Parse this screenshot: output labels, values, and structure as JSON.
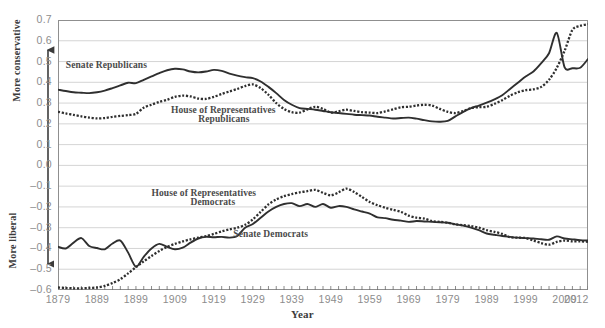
{
  "chart_data": {
    "type": "line",
    "title": "",
    "xlabel": "Year",
    "ylabel_top": "More conservative",
    "ylabel_bottom": "More liberal",
    "ylim": [
      -0.6,
      0.7
    ],
    "xlim": [
      1879,
      2015
    ],
    "grid": true,
    "legend_position": "inline-annotations",
    "ytick_labels": [
      "0.7",
      "0.6",
      "0.5",
      "0.4",
      "0.3",
      "0.2",
      "0.1",
      "0.0",
      "–0.1",
      "–0.2",
      "–0.3",
      "–0.4",
      "–0.5",
      "–0.6"
    ],
    "ytick_values": [
      0.7,
      0.6,
      0.5,
      0.4,
      0.3,
      0.2,
      0.1,
      0.0,
      -0.1,
      -0.2,
      -0.3,
      -0.4,
      -0.5,
      -0.6
    ],
    "xtick_labels": [
      "1879",
      "1889",
      "1899",
      "1909",
      "1919",
      "1929",
      "1939",
      "1949",
      "1959",
      "1969",
      "1979",
      "1989",
      "1999",
      "2009",
      "2012"
    ],
    "xtick_values": [
      1879,
      1889,
      1899,
      1909,
      1919,
      1929,
      1939,
      1949,
      1959,
      1969,
      1979,
      1989,
      1999,
      2009,
      2012
    ],
    "minor_tick_interval": 2,
    "series": [
      {
        "name": "Senate Republicans",
        "style": "solid",
        "color": "#2f2f2f",
        "x": [
          1879,
          1881,
          1883,
          1885,
          1887,
          1889,
          1891,
          1893,
          1895,
          1897,
          1899,
          1901,
          1903,
          1905,
          1907,
          1909,
          1911,
          1913,
          1915,
          1917,
          1919,
          1921,
          1923,
          1925,
          1927,
          1929,
          1931,
          1933,
          1935,
          1937,
          1939,
          1941,
          1943,
          1945,
          1947,
          1949,
          1951,
          1953,
          1955,
          1957,
          1959,
          1961,
          1963,
          1965,
          1967,
          1969,
          1971,
          1973,
          1975,
          1977,
          1979,
          1981,
          1983,
          1985,
          1987,
          1989,
          1991,
          1993,
          1995,
          1997,
          1999,
          2001,
          2003,
          2005,
          2007,
          2009,
          2011,
          2013,
          2015
        ],
        "values": [
          0.365,
          0.358,
          0.352,
          0.35,
          0.348,
          0.352,
          0.36,
          0.372,
          0.385,
          0.398,
          0.396,
          0.412,
          0.428,
          0.444,
          0.458,
          0.465,
          0.462,
          0.452,
          0.448,
          0.452,
          0.46,
          0.455,
          0.442,
          0.432,
          0.425,
          0.42,
          0.404,
          0.378,
          0.348,
          0.315,
          0.292,
          0.276,
          0.272,
          0.268,
          0.262,
          0.256,
          0.252,
          0.248,
          0.244,
          0.242,
          0.24,
          0.234,
          0.23,
          0.226,
          0.228,
          0.23,
          0.225,
          0.218,
          0.212,
          0.21,
          0.214,
          0.236,
          0.258,
          0.276,
          0.288,
          0.302,
          0.318,
          0.338,
          0.368,
          0.398,
          0.428,
          0.452,
          0.492,
          0.54,
          0.638,
          0.472,
          0.468,
          0.47,
          0.512
        ]
      },
      {
        "name": "House of Representatives Republicans",
        "style": "dotted",
        "color": "#2f2f2f",
        "x": [
          1879,
          1881,
          1883,
          1885,
          1887,
          1889,
          1891,
          1893,
          1895,
          1897,
          1899,
          1901,
          1903,
          1905,
          1907,
          1909,
          1911,
          1913,
          1915,
          1917,
          1919,
          1921,
          1923,
          1925,
          1927,
          1929,
          1931,
          1933,
          1935,
          1937,
          1939,
          1941,
          1943,
          1945,
          1947,
          1949,
          1951,
          1953,
          1955,
          1957,
          1959,
          1961,
          1963,
          1965,
          1967,
          1969,
          1971,
          1973,
          1975,
          1977,
          1979,
          1981,
          1983,
          1985,
          1987,
          1989,
          1991,
          1993,
          1995,
          1997,
          1999,
          2001,
          2003,
          2005,
          2007,
          2009,
          2011,
          2013,
          2015
        ],
        "values": [
          0.258,
          0.25,
          0.243,
          0.236,
          0.23,
          0.226,
          0.228,
          0.234,
          0.238,
          0.242,
          0.248,
          0.278,
          0.292,
          0.306,
          0.316,
          0.33,
          0.336,
          0.332,
          0.322,
          0.32,
          0.33,
          0.344,
          0.356,
          0.368,
          0.382,
          0.39,
          0.372,
          0.34,
          0.3,
          0.272,
          0.256,
          0.254,
          0.27,
          0.282,
          0.272,
          0.254,
          0.26,
          0.268,
          0.262,
          0.256,
          0.254,
          0.252,
          0.26,
          0.27,
          0.28,
          0.282,
          0.288,
          0.292,
          0.288,
          0.272,
          0.258,
          0.252,
          0.262,
          0.276,
          0.28,
          0.282,
          0.296,
          0.314,
          0.336,
          0.352,
          0.362,
          0.366,
          0.378,
          0.412,
          0.47,
          0.552,
          0.652,
          0.672,
          0.68
        ]
      },
      {
        "name": "House of Representatives Democrats",
        "style": "dotted",
        "color": "#2f2f2f",
        "x": [
          1879,
          1881,
          1883,
          1885,
          1887,
          1889,
          1891,
          1893,
          1895,
          1897,
          1899,
          1901,
          1903,
          1905,
          1907,
          1909,
          1911,
          1913,
          1915,
          1917,
          1919,
          1921,
          1923,
          1925,
          1927,
          1929,
          1931,
          1933,
          1935,
          1937,
          1939,
          1941,
          1943,
          1945,
          1947,
          1949,
          1951,
          1953,
          1955,
          1957,
          1959,
          1961,
          1963,
          1965,
          1967,
          1969,
          1971,
          1973,
          1975,
          1977,
          1979,
          1981,
          1983,
          1985,
          1987,
          1989,
          1991,
          1993,
          1995,
          1997,
          1999,
          2001,
          2003,
          2005,
          2007,
          2009,
          2011,
          2013,
          2015
        ],
        "values": [
          -0.588,
          -0.59,
          -0.592,
          -0.592,
          -0.59,
          -0.588,
          -0.58,
          -0.566,
          -0.548,
          -0.52,
          -0.49,
          -0.462,
          -0.436,
          -0.412,
          -0.392,
          -0.378,
          -0.366,
          -0.356,
          -0.348,
          -0.34,
          -0.33,
          -0.318,
          -0.308,
          -0.3,
          -0.286,
          -0.26,
          -0.224,
          -0.188,
          -0.164,
          -0.148,
          -0.138,
          -0.13,
          -0.124,
          -0.118,
          -0.132,
          -0.144,
          -0.13,
          -0.112,
          -0.128,
          -0.152,
          -0.176,
          -0.192,
          -0.204,
          -0.214,
          -0.224,
          -0.242,
          -0.252,
          -0.256,
          -0.268,
          -0.272,
          -0.276,
          -0.284,
          -0.288,
          -0.292,
          -0.3,
          -0.312,
          -0.32,
          -0.33,
          -0.346,
          -0.348,
          -0.35,
          -0.362,
          -0.374,
          -0.382,
          -0.368,
          -0.362,
          -0.366,
          -0.366,
          -0.368
        ]
      },
      {
        "name": "Senate Democrats",
        "style": "solid",
        "color": "#2f2f2f",
        "x": [
          1879,
          1881,
          1883,
          1885,
          1887,
          1889,
          1891,
          1893,
          1895,
          1897,
          1899,
          1901,
          1903,
          1905,
          1907,
          1909,
          1911,
          1913,
          1915,
          1917,
          1919,
          1921,
          1923,
          1925,
          1927,
          1929,
          1931,
          1933,
          1935,
          1937,
          1939,
          1941,
          1943,
          1945,
          1947,
          1949,
          1951,
          1953,
          1955,
          1957,
          1959,
          1961,
          1963,
          1965,
          1967,
          1969,
          1971,
          1973,
          1975,
          1977,
          1979,
          1981,
          1983,
          1985,
          1987,
          1989,
          1991,
          1993,
          1995,
          1997,
          1999,
          2001,
          2003,
          2005,
          2007,
          2009,
          2011,
          2013,
          2015
        ],
        "values": [
          -0.392,
          -0.4,
          -0.372,
          -0.35,
          -0.388,
          -0.398,
          -0.404,
          -0.376,
          -0.362,
          -0.42,
          -0.488,
          -0.44,
          -0.4,
          -0.378,
          -0.392,
          -0.404,
          -0.396,
          -0.372,
          -0.352,
          -0.344,
          -0.346,
          -0.344,
          -0.348,
          -0.34,
          -0.3,
          -0.282,
          -0.252,
          -0.222,
          -0.2,
          -0.186,
          -0.182,
          -0.196,
          -0.186,
          -0.2,
          -0.186,
          -0.204,
          -0.196,
          -0.2,
          -0.212,
          -0.222,
          -0.232,
          -0.25,
          -0.254,
          -0.262,
          -0.266,
          -0.272,
          -0.268,
          -0.27,
          -0.272,
          -0.274,
          -0.276,
          -0.284,
          -0.29,
          -0.3,
          -0.312,
          -0.328,
          -0.334,
          -0.34,
          -0.344,
          -0.348,
          -0.35,
          -0.352,
          -0.356,
          -0.358,
          -0.342,
          -0.352,
          -0.356,
          -0.36,
          -0.362
        ]
      }
    ],
    "annotations": [
      {
        "text": "Senate Republicans",
        "x": 1881,
        "y": 0.485,
        "align": "left"
      },
      {
        "text": "House of Representatives",
        "x": 1908,
        "y": 0.268,
        "align": "left"
      },
      {
        "text": "Republicans",
        "x": 1915,
        "y": 0.222,
        "align": "left"
      },
      {
        "text": "House of Representatives",
        "x": 1903,
        "y": -0.135,
        "align": "left"
      },
      {
        "text": "Democrats",
        "x": 1913,
        "y": -0.178,
        "align": "left"
      },
      {
        "text": "Senate Democrats",
        "x": 1924,
        "y": -0.33,
        "align": "left"
      }
    ]
  },
  "axes": {
    "x_axis_title": "Year",
    "y_axis_top_title": "More conservative",
    "y_axis_bottom_title": "More liberal"
  },
  "colors": {
    "line": "#2f2f2f",
    "grid": "#c9c9c9",
    "frame": "#8f8f8f",
    "tick_text": "#8d8d8d",
    "label_text": "#4a4a4a",
    "background": "#ffffff"
  }
}
